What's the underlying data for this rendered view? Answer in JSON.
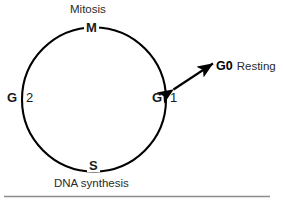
{
  "figure": {
    "background_color": "#ffffff",
    "stroke_color": "#000000",
    "rule_color": "#8c8c8c"
  },
  "cycle": {
    "shape": "circle",
    "phases": [
      {
        "code": "M",
        "number": "",
        "position": "top",
        "caption": "Mitosis"
      },
      {
        "code": "G",
        "number": "1",
        "position": "right",
        "caption": ""
      },
      {
        "code": "S",
        "number": "",
        "position": "bottom",
        "caption": "DNA synthesis"
      },
      {
        "code": "G",
        "number": "2",
        "position": "left",
        "caption": ""
      }
    ]
  },
  "annotations": {
    "mitosis_label": "Mitosis",
    "dna_label": "DNA synthesis",
    "m_label": "M",
    "s_label": "S",
    "g1_code": "G",
    "g1_number": "1",
    "g2_code": "G",
    "g2_number": "2",
    "g0_code": "G0",
    "g0_word": "Resting",
    "arrow_type": "double-headed",
    "arrow_from": "G1",
    "arrow_to": "G0 Resting"
  }
}
